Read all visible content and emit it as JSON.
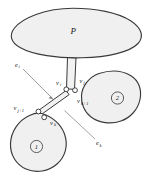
{
  "figure": {
    "background_color": "#ffffff",
    "blob_fill_color": "#f0f0f0",
    "blob_stroke_color": "#3a3a3a",
    "leader_color": "#8a8a8a",
    "width": 152,
    "height": 180
  },
  "regions": {
    "parent": {
      "label": "P",
      "name": "region-p"
    },
    "sub_one": {
      "label": "1",
      "name": "region-one"
    },
    "sub_two": {
      "label": "2",
      "name": "region-two"
    }
  },
  "vertices": {
    "v_i": {
      "base": "v",
      "sub": "i"
    },
    "v_j": {
      "base": "v",
      "sub": "j"
    },
    "v_k_plus_1": {
      "base": "v",
      "sub": "k+1"
    },
    "v_j_plus_1": {
      "base": "v",
      "sub": "j+1"
    },
    "v_k": {
      "base": "v",
      "sub": "k"
    }
  },
  "edges": {
    "e_i": {
      "base": "e",
      "sub": "i"
    },
    "e_k": {
      "base": "e",
      "sub": "k"
    }
  }
}
